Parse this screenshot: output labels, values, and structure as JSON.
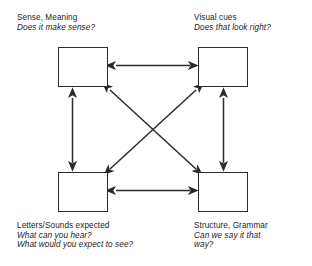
{
  "diagram": {
    "background_color": "#ffffff",
    "stroke_color": "#2b2b2b",
    "text_color": "#1c1c1c",
    "nodes": [
      {
        "id": "sense",
        "heading": "Sense, Meaning",
        "questions": [
          "Does it make sense?"
        ],
        "position": "top-left"
      },
      {
        "id": "visual",
        "heading": "Visual cues",
        "questions": [
          "Does that look right?"
        ],
        "position": "top-right"
      },
      {
        "id": "letters",
        "heading": "Letters/Sounds expected",
        "questions": [
          "What can you hear?",
          "What would you expect to see?"
        ],
        "position": "bottom-left"
      },
      {
        "id": "structure",
        "heading": "Structure, Grammar",
        "questions": [
          "Can we say it that",
          "way?"
        ],
        "position": "bottom-right"
      }
    ],
    "connections": [
      {
        "id": "sense-visual",
        "from": "sense",
        "to": "visual",
        "style": "double-headed",
        "orientation": "horizontal"
      },
      {
        "id": "letters-structure",
        "from": "letters",
        "to": "structure",
        "style": "double-headed",
        "orientation": "horizontal"
      },
      {
        "id": "sense-letters",
        "from": "sense",
        "to": "letters",
        "style": "double-headed",
        "orientation": "vertical"
      },
      {
        "id": "visual-structure",
        "from": "visual",
        "to": "structure",
        "style": "double-headed",
        "orientation": "vertical"
      },
      {
        "id": "sense-structure",
        "from": "sense",
        "to": "structure",
        "style": "double-headed",
        "orientation": "diagonal"
      },
      {
        "id": "visual-letters",
        "from": "visual",
        "to": "letters",
        "style": "double-headed",
        "orientation": "diagonal"
      }
    ]
  }
}
